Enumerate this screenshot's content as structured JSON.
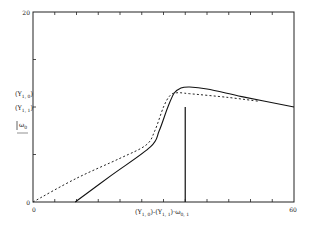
{
  "chart_data": {
    "type": "line",
    "title": "",
    "xlabel": "(Y1,0)-(Y1,1)·ω0,1",
    "ylabel": "|ω0|",
    "xlim": [
      0,
      60
    ],
    "ylim": [
      0,
      20
    ],
    "x_tick_labels": [
      "0",
      "60"
    ],
    "y_tick_labels": [
      "0",
      "20"
    ],
    "x_tick_count": 12,
    "y_tick_count": 4,
    "y_annotations": [
      {
        "label": "(Y1,0)",
        "value": 11.5
      },
      {
        "label": "(Y1,1)",
        "value": 10
      }
    ],
    "grid": false,
    "legend": null,
    "series": [
      {
        "name": "solid",
        "style": "solid",
        "x": [
          9.7,
          18,
          27,
          29,
          31,
          32.5,
          34,
          36,
          40,
          48,
          60
        ],
        "y": [
          0,
          2.8,
          5.8,
          7.5,
          10,
          11.5,
          12.0,
          12.1,
          11.9,
          11.1,
          10.0
        ]
      },
      {
        "name": "dashed",
        "style": "dashed",
        "x": [
          0,
          10,
          20,
          26,
          28,
          30,
          31.5,
          33,
          36,
          45,
          52
        ],
        "y": [
          0,
          2.5,
          4.6,
          6.0,
          7.5,
          10.0,
          11.2,
          11.5,
          11.4,
          11.0,
          10.6
        ]
      }
    ],
    "vertical_marker": {
      "x": 35,
      "y_from": 0,
      "y_to": 10
    }
  },
  "axes": {
    "y_top_label": "20",
    "y_bottom_label": "0",
    "x_left_label": "0",
    "x_right_label": "60",
    "y_annotation_0": "(Y",
    "y_annotation_0_sub": "1, 0",
    "y_annotation_0_close": ")",
    "y_annotation_1": "(Y",
    "y_annotation_1_sub": "1, 1",
    "y_annotation_1_close": ")",
    "ylabel_main": "ω",
    "ylabel_sub": "0",
    "xlabel_part1": "(Y",
    "xlabel_part1_sub": "1, 0",
    "xlabel_part2": ")-(Y",
    "xlabel_part2_sub": "1, 1",
    "xlabel_part3": ")·ω",
    "xlabel_part3_sub": "0, 1"
  }
}
